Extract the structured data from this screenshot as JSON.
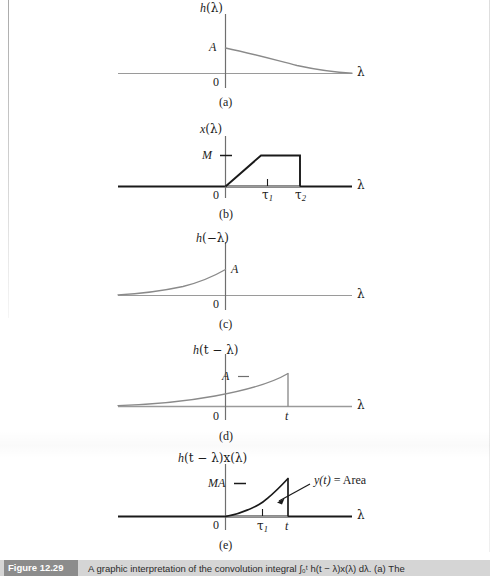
{
  "figure": {
    "number_label": "Figure 12.29",
    "caption": "A graphic interpretation of the convolution integral ∫₀ᵗ h(t − λ)x(λ) dλ. (a) The",
    "axis_symbol": "λ",
    "origin_label": "0"
  },
  "panels": [
    {
      "id": "a",
      "letter": "(a)",
      "ylabel": "h(λ)",
      "ylabel_parts": {
        "fn": "h",
        "arg": "(λ)"
      },
      "amplitude_label": "A",
      "xaxis_label": "λ",
      "origin_label": "0",
      "ticks": [],
      "curve": "decaying-exponential-right"
    },
    {
      "id": "b",
      "letter": "(b)",
      "ylabel": "x(λ)",
      "ylabel_parts": {
        "fn": "x",
        "arg": "(λ)"
      },
      "amplitude_label": "M",
      "xaxis_label": "λ",
      "origin_label": "0",
      "ticks": [
        {
          "label": "τ",
          "sub": "1"
        },
        {
          "label": "τ",
          "sub": "2"
        }
      ],
      "curve": "trapezoid-ramp-plateau-drop"
    },
    {
      "id": "c",
      "letter": "(c)",
      "ylabel": "h(−λ)",
      "ylabel_parts": {
        "fn": "h",
        "arg": "(−λ)"
      },
      "amplitude_label": "A",
      "xaxis_label": "λ",
      "origin_label": "0",
      "ticks": [],
      "curve": "rising-exponential-left-mirrored"
    },
    {
      "id": "d",
      "letter": "(d)",
      "ylabel": "h(t − λ)",
      "ylabel_parts": {
        "fn": "h",
        "arg": "(t − λ)"
      },
      "amplitude_label": "A",
      "xaxis_label": "λ",
      "origin_label": "0",
      "ticks": [
        {
          "label": "t",
          "sub": ""
        }
      ],
      "curve": "shifted-rising-exponential-cut-at-t"
    },
    {
      "id": "e",
      "letter": "(e)",
      "ylabel": "h(t − λ)x(λ)",
      "ylabel_parts": {
        "fn": "h",
        "arg": "(t − λ)x(λ)"
      },
      "amplitude_label": "MA",
      "xaxis_label": "λ",
      "origin_label": "0",
      "ticks": [
        {
          "label": "τ",
          "sub": "1"
        },
        {
          "label": "t",
          "sub": ""
        }
      ],
      "annotation": "y(t) = Area",
      "annotation_parts": {
        "fn": "y",
        "arg": "(t)",
        "eq": " = Area"
      },
      "curve": "product-area-curve"
    }
  ],
  "colors": {
    "page_background": "#ffffff",
    "curve_gray": "#8a8a8a",
    "curve_black": "#1a1a1a",
    "axis_gray": "#9a9a9a",
    "axis_black": "#1a1a1a",
    "caption_bar": "#d5d5d5",
    "caption_tag": "#8c8c8c"
  }
}
